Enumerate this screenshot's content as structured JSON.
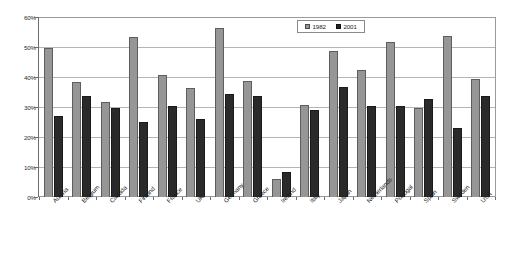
{
  "chart_data": {
    "type": "bar",
    "title": "",
    "xlabel": "",
    "ylabel": "",
    "ylim": [
      0,
      60
    ],
    "ytick_labels": [
      "0%",
      "10%",
      "20%",
      "30%",
      "40%",
      "50%",
      "60%"
    ],
    "ytick_values": [
      0,
      10,
      20,
      30,
      40,
      50,
      60
    ],
    "grid": true,
    "legend_position": "top-right",
    "categories": [
      "Austria",
      "Belgium",
      "Canada",
      "Finland",
      "France",
      "UK",
      "Germany",
      "Greece",
      "Ireland",
      "Italy",
      "Japan",
      "Netherlands",
      "Portugal",
      "Spain",
      "Sweden",
      "USA"
    ],
    "series": [
      {
        "name": "1982",
        "color": "#969696",
        "values": [
          50.0,
          38.5,
          32.0,
          53.5,
          41.0,
          36.5,
          56.5,
          39.0,
          6.0,
          31.0,
          49.0,
          42.5,
          52.0,
          30.0,
          54.0,
          39.5
        ]
      },
      {
        "name": "2001",
        "color": "#232323",
        "values": [
          27.0,
          34.0,
          30.0,
          25.0,
          30.5,
          26.0,
          34.5,
          34.0,
          8.5,
          29.0,
          37.0,
          30.5,
          30.5,
          33.0,
          23.0,
          34.0
        ]
      }
    ]
  },
  "legend": {
    "items": [
      {
        "label": "1982"
      },
      {
        "label": "2001"
      }
    ]
  }
}
